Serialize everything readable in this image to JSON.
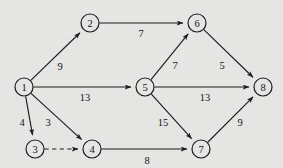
{
  "figure": {
    "width": 283,
    "height": 168,
    "background_color": "#e8e8e6",
    "stroke_color": "#1a1a1a",
    "text_color": "#111111",
    "node_radius": 9
  },
  "chart_data": {
    "type": "diagram",
    "diagram_kind": "directed-weighted-graph",
    "title": "",
    "nodes": [
      {
        "id": "1",
        "label": "1",
        "x": 24,
        "y": 87
      },
      {
        "id": "2",
        "label": "2",
        "x": 90,
        "y": 23
      },
      {
        "id": "3",
        "label": "3",
        "x": 35,
        "y": 149
      },
      {
        "id": "4",
        "label": "4",
        "x": 92,
        "y": 149
      },
      {
        "id": "5",
        "label": "5",
        "x": 145,
        "y": 87
      },
      {
        "id": "6",
        "label": "6",
        "x": 197,
        "y": 23
      },
      {
        "id": "7",
        "label": "7",
        "x": 201,
        "y": 149
      },
      {
        "id": "8",
        "label": "8",
        "x": 263,
        "y": 87
      }
    ],
    "edges": [
      {
        "from": "1",
        "to": "2",
        "weight": "9",
        "style": "solid",
        "directed": true,
        "label_x": 60,
        "label_y": 66
      },
      {
        "from": "2",
        "to": "6",
        "weight": "7",
        "style": "solid",
        "directed": true,
        "label_x": 141,
        "label_y": 33
      },
      {
        "from": "1",
        "to": "5",
        "weight": "13",
        "style": "solid",
        "directed": true,
        "label_x": 85,
        "label_y": 97
      },
      {
        "from": "5",
        "to": "6",
        "weight": "7",
        "style": "solid",
        "directed": true,
        "label_x": 175,
        "label_y": 65
      },
      {
        "from": "6",
        "to": "8",
        "weight": "5",
        "style": "solid",
        "directed": true,
        "label_x": 222,
        "label_y": 65
      },
      {
        "from": "5",
        "to": "8",
        "weight": "13",
        "style": "solid",
        "directed": true,
        "label_x": 205,
        "label_y": 97
      },
      {
        "from": "1",
        "to": "3",
        "weight": "4",
        "style": "solid",
        "directed": true,
        "label_x": 22,
        "label_y": 122
      },
      {
        "from": "1",
        "to": "4",
        "weight": "3",
        "style": "solid",
        "directed": true,
        "label_x": 48,
        "label_y": 122
      },
      {
        "from": "3",
        "to": "4",
        "weight": "",
        "style": "dashed",
        "directed": true,
        "label_x": 63,
        "label_y": 140
      },
      {
        "from": "4",
        "to": "7",
        "weight": "8",
        "style": "solid",
        "directed": true,
        "label_x": 147,
        "label_y": 160
      },
      {
        "from": "5",
        "to": "7",
        "weight": "15",
        "style": "solid",
        "directed": true,
        "label_x": 163,
        "label_y": 122
      },
      {
        "from": "7",
        "to": "8",
        "weight": "9",
        "style": "solid",
        "directed": true,
        "label_x": 240,
        "label_y": 122
      }
    ]
  }
}
